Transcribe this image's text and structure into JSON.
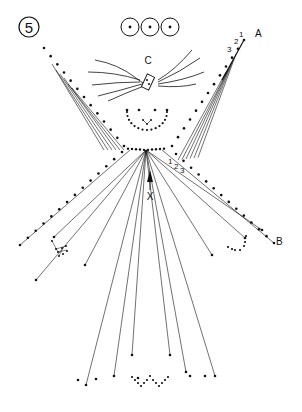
{
  "figure": {
    "step_number": "5",
    "ink_color": "#111111",
    "background_color": "#ffffff"
  },
  "labels": {
    "point_a": "A",
    "point_b": "B",
    "point_c": "C",
    "point_x": "X",
    "seq_a": [
      "1",
      "2",
      "3"
    ],
    "seq_b": [
      "1",
      "2",
      "3"
    ]
  },
  "parts": {
    "eyes_circles": 3,
    "hair_strands": 9,
    "left_arm_pins": 13,
    "right_arm_pins": 13,
    "left_sleeve_pins": 14,
    "right_sleeve_pins": 14,
    "fan_lines_to_hem": 6
  }
}
